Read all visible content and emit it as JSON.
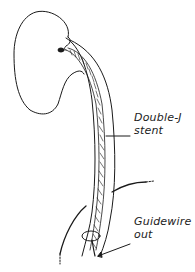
{
  "diagram": {
    "colors": {
      "stroke": "#1a1a1a",
      "background": "#ffffff"
    },
    "labels": [
      {
        "id": "stent",
        "lines": [
          "Double-J",
          "stent"
        ]
      },
      {
        "id": "guidewire",
        "lines": [
          "Guidewire",
          "out"
        ]
      }
    ]
  }
}
